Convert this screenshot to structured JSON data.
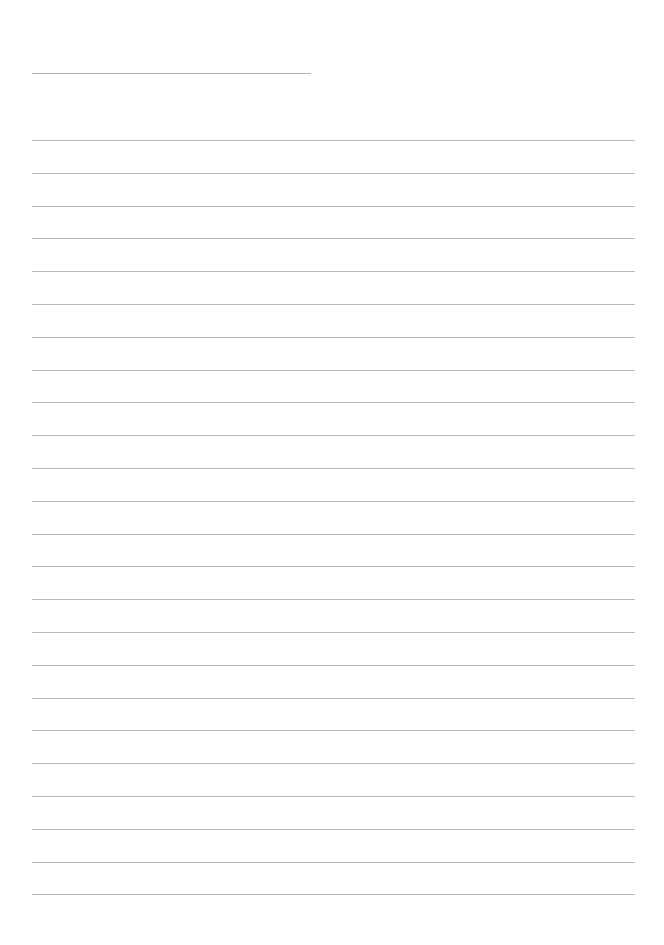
{
  "page": {
    "type": "lined-paper",
    "header_line": {
      "x": 32,
      "y": 73,
      "width": 279
    },
    "rules": {
      "count": 24,
      "first_y": 140,
      "spacing": 32.8,
      "x": 32,
      "width": 603
    },
    "colors": {
      "background": "#ffffff",
      "rule": "#b9b9b9"
    }
  }
}
